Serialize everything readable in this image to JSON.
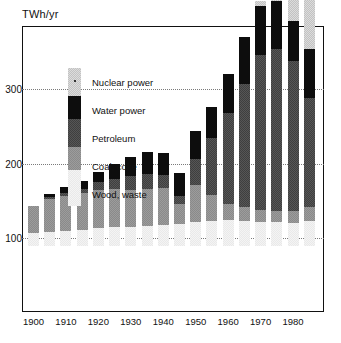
{
  "axis": {
    "unit_label": "TWh/yr",
    "y_ticks": [
      "100",
      "200",
      "300"
    ],
    "y_tick_values": [
      100,
      200,
      300
    ],
    "x_ticks": [
      "1900",
      "1910",
      "1920",
      "1930",
      "1940",
      "1950",
      "1960",
      "1970",
      "1980"
    ],
    "x_tick_values": [
      1900,
      1910,
      1920,
      1930,
      1940,
      1950,
      1960,
      1970,
      1980
    ]
  },
  "legend": {
    "items": [
      {
        "label": "Nuclear power",
        "key": "nuclear",
        "color": "#dcdcdc"
      },
      {
        "label": "Water power",
        "key": "water",
        "color": "#0d0d0d"
      },
      {
        "label": "Petroleum",
        "key": "petroleum",
        "color": "#565656"
      },
      {
        "label": "Coal, coke",
        "key": "coal",
        "color": "#9c9c9c"
      },
      {
        "label": "Wood, waste",
        "key": "wood",
        "color": "#f4f4f4"
      }
    ]
  },
  "chart_data": {
    "type": "bar",
    "stacked": true,
    "title": "",
    "subtitle": "",
    "xlabel": "",
    "ylabel": "TWh/yr",
    "ylim": [
      0,
      330
    ],
    "grid": true,
    "gridlines": [
      100,
      200,
      300
    ],
    "legend_position": "inside-upper-left",
    "categories": [
      "1900",
      "1905",
      "1910",
      "1915",
      "1920",
      "1925",
      "1930",
      "1935",
      "1940",
      "1945",
      "1950",
      "1955",
      "1960",
      "1965",
      "1970",
      "1975",
      "1980",
      "1985"
    ],
    "series": [
      {
        "name": "Wood, waste",
        "values": [
          18,
          19,
          20,
          22,
          24,
          25,
          26,
          27,
          28,
          30,
          32,
          34,
          35,
          34,
          33,
          32,
          31,
          34
        ]
      },
      {
        "name": "Coal, coke",
        "values": [
          36,
          45,
          48,
          50,
          52,
          52,
          50,
          50,
          50,
          27,
          50,
          35,
          22,
          18,
          16,
          15,
          16,
          19
        ]
      },
      {
        "name": "Petroleum",
        "values": [
          0,
          2,
          3,
          5,
          10,
          14,
          18,
          20,
          18,
          10,
          35,
          76,
          122,
          167,
          208,
          218,
          203,
          147
        ]
      },
      {
        "name": "Water power",
        "values": [
          0,
          4,
          8,
          11,
          14,
          20,
          26,
          30,
          30,
          31,
          38,
          42,
          53,
          63,
          67,
          65,
          53,
          66
        ]
      },
      {
        "name": "Nuclear power",
        "values": [
          0,
          0,
          0,
          0,
          0,
          0,
          0,
          0,
          0,
          0,
          0,
          0,
          0,
          0,
          6,
          26,
          28,
          68
        ]
      }
    ],
    "totals": [
      54,
      70,
      79,
      88,
      100,
      111,
      120,
      127,
      126,
      98,
      155,
      187,
      232,
      282,
      330,
      356,
      331,
      334
    ]
  },
  "colors": {
    "wood": "#f4f4f4",
    "coal": "#9c9c9c",
    "petroleum": "#565656",
    "water": "#0d0d0d",
    "nuclear": "#dcdcdc",
    "frame": "#111111",
    "grid": "#7a7a7a"
  }
}
